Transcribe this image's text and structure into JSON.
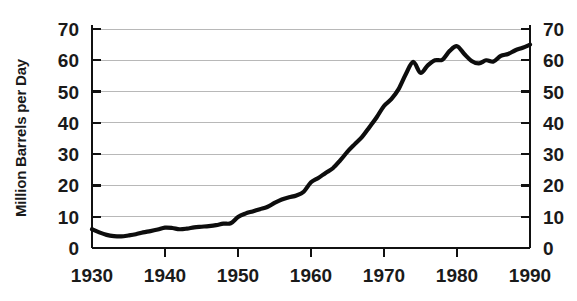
{
  "chart_data": {
    "type": "line",
    "title": "",
    "subtitle": "",
    "xlabel": "",
    "ylabel": "Million Barrels per Day",
    "ylabel_right": "Million Barrels per Day",
    "xlim": [
      1930,
      1990
    ],
    "ylim": [
      0,
      70
    ],
    "grid": true,
    "grid_axis": "y",
    "legend": false,
    "legend_position": "none",
    "line_color": "#0d0d0d",
    "grid_color": "#b8b8b8",
    "axis_color": "#111111",
    "background_color": "#ffffff",
    "x_ticks": [
      1930,
      1940,
      1950,
      1960,
      1970,
      1980,
      1990
    ],
    "x_tick_labels": [
      "1930",
      "1940",
      "1950",
      "1960",
      "1970",
      "1980",
      "1990"
    ],
    "y_ticks": [
      0,
      10,
      20,
      30,
      40,
      50,
      60,
      70
    ],
    "y_tick_labels": [
      "0",
      "10",
      "20",
      "30",
      "40",
      "50",
      "60",
      "70"
    ],
    "y_ticks_right": [
      0,
      10,
      20,
      30,
      40,
      50,
      60,
      70
    ],
    "y_tick_labels_right": [
      "0",
      "10",
      "20",
      "30",
      "40",
      "50",
      "60",
      "70"
    ],
    "series": [
      {
        "name": "World Oil Production",
        "x": [
          1930,
          1931,
          1932,
          1933,
          1934,
          1935,
          1936,
          1937,
          1938,
          1939,
          1940,
          1941,
          1942,
          1943,
          1944,
          1945,
          1946,
          1947,
          1948,
          1949,
          1950,
          1951,
          1952,
          1953,
          1954,
          1955,
          1956,
          1957,
          1958,
          1959,
          1960,
          1961,
          1962,
          1963,
          1964,
          1965,
          1966,
          1967,
          1968,
          1969,
          1970,
          1971,
          1972,
          1973,
          1974,
          1975,
          1976,
          1977,
          1978,
          1979,
          1980,
          1981,
          1982,
          1983,
          1984,
          1985,
          1986,
          1987,
          1988,
          1989,
          1990
        ],
        "values": [
          6.0,
          5.0,
          4.2,
          3.8,
          3.7,
          4.0,
          4.4,
          5.0,
          5.4,
          5.9,
          6.5,
          6.4,
          6.0,
          6.2,
          6.6,
          6.8,
          7.0,
          7.3,
          7.8,
          7.9,
          9.9,
          11.0,
          11.7,
          12.4,
          13.1,
          14.4,
          15.5,
          16.2,
          16.8,
          18.0,
          21.0,
          22.4,
          24.0,
          25.5,
          28.0,
          30.8,
          33.2,
          35.5,
          38.6,
          41.8,
          45.4,
          47.6,
          50.8,
          55.6,
          59.5,
          56.0,
          58.4,
          60.0,
          60.2,
          63.0,
          64.5,
          62.0,
          59.8,
          59.0,
          60.0,
          59.6,
          61.4,
          62.0,
          63.2,
          64.0,
          65.0
        ],
        "color": "#0d0d0d",
        "line_width": 4.2
      }
    ],
    "annotations": []
  },
  "plot_geometry": {
    "left": 92,
    "right": 530,
    "top": 29,
    "bottom": 248
  },
  "axis_titles": {
    "left": "Million Barrels per Day"
  }
}
